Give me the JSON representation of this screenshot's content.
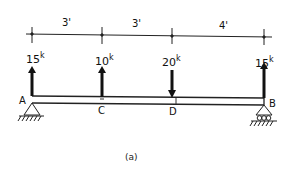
{
  "diagram": {
    "caption": "(a)",
    "dimensions": [
      {
        "label": "3'",
        "from": "A",
        "to": "C"
      },
      {
        "label": "3'",
        "from": "C",
        "to": "D"
      },
      {
        "label": "4'",
        "from": "D",
        "to": "B"
      }
    ],
    "loads": [
      {
        "point": "A",
        "value": "15",
        "unit": "k",
        "direction": "up"
      },
      {
        "point": "C",
        "value": "10",
        "unit": "k",
        "direction": "up"
      },
      {
        "point": "D",
        "value": "20",
        "unit": "k",
        "direction": "down"
      },
      {
        "point": "B",
        "value": "15",
        "unit": "k",
        "direction": "up"
      }
    ],
    "points": [
      {
        "label": "A",
        "support": "pin"
      },
      {
        "label": "C"
      },
      {
        "label": "D"
      },
      {
        "label": "B",
        "support": "roller"
      }
    ],
    "colors": {
      "ink": "#111111",
      "background": "#ffffff"
    }
  }
}
